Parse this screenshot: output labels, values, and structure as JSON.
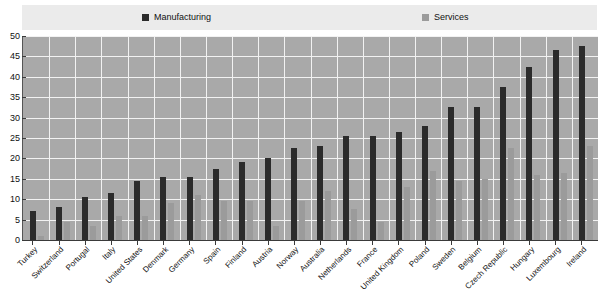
{
  "legend": {
    "entries": [
      {
        "label": "Manufacturing",
        "color": "#2b2b2b",
        "swatch_name": "manufacturing-swatch"
      },
      {
        "label": "Services",
        "color": "#9b9b9b",
        "swatch_name": "services-swatch"
      }
    ]
  },
  "axis": {
    "y_ticks": [
      "50",
      "45",
      "40",
      "35",
      "30",
      "25",
      "20",
      "15",
      "10",
      "5",
      "0"
    ]
  },
  "chart_data": {
    "type": "bar",
    "title": "",
    "subtitle": "",
    "xlabel": "",
    "ylabel": "",
    "ylim": [
      0,
      50
    ],
    "ytick_step": 5,
    "grid": true,
    "legend_position": "top",
    "categories": [
      "Turkey",
      "Switzerland",
      "Portugal",
      "Italy",
      "United States",
      "Denmark",
      "Germany",
      "Spain",
      "Finland",
      "Austria",
      "Norway",
      "Australia",
      "Netherlands",
      "France",
      "United Kingdom",
      "Poland",
      "Sweden",
      "Belgium",
      "Czech Republic",
      "Hungary",
      "Luxembourg",
      "Ireland"
    ],
    "series": [
      {
        "name": "Manufacturing",
        "color": "#2b2b2b",
        "values": [
          7,
          8,
          10.5,
          11.5,
          14.5,
          15.5,
          15.5,
          17.5,
          19,
          20,
          22.5,
          23,
          25.5,
          25.5,
          26.5,
          28,
          32.5,
          32.5,
          37.5,
          42.5,
          46.5,
          47.5
        ]
      },
      {
        "name": "Services",
        "color": "#9b9b9b",
        "values": [
          1,
          4.5,
          3.5,
          6,
          6,
          9,
          11,
          9.5,
          9.5,
          3.5,
          9.5,
          12,
          7.5,
          4.5,
          13,
          17,
          14.5,
          15,
          22.5,
          16,
          16.5,
          23
        ]
      }
    ]
  }
}
